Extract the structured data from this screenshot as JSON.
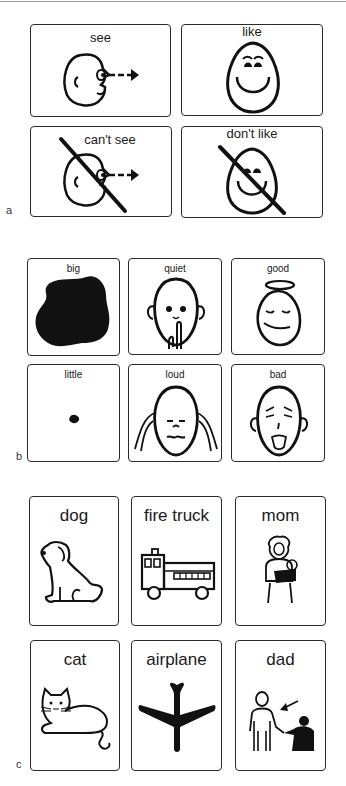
{
  "figure": {
    "panels": [
      {
        "letter": "a",
        "cards": [
          {
            "label": "see",
            "icon": "face-looking-arrow-icon"
          },
          {
            "label": "like",
            "icon": "smiling-face-icon"
          },
          {
            "label": "can't see",
            "icon": "face-looking-arrow-crossed-icon"
          },
          {
            "label": "don't like",
            "icon": "smiling-face-crossed-icon"
          }
        ]
      },
      {
        "letter": "b",
        "cards": [
          {
            "label": "big",
            "icon": "large-blob-icon"
          },
          {
            "label": "quiet",
            "icon": "shushing-face-icon"
          },
          {
            "label": "good",
            "icon": "angel-face-icon"
          },
          {
            "label": "little",
            "icon": "small-dot-icon"
          },
          {
            "label": "loud",
            "icon": "covering-ears-face-icon"
          },
          {
            "label": "bad",
            "icon": "disgusted-face-icon"
          }
        ]
      },
      {
        "letter": "c",
        "cards": [
          {
            "label": "dog",
            "icon": "dog-icon"
          },
          {
            "label": "fire truck",
            "icon": "fire-truck-icon"
          },
          {
            "label": "mom",
            "icon": "mother-holding-baby-icon"
          },
          {
            "label": "cat",
            "icon": "cat-icon"
          },
          {
            "label": "airplane",
            "icon": "airplane-icon"
          },
          {
            "label": "dad",
            "icon": "father-with-child-icon"
          }
        ]
      }
    ]
  }
}
